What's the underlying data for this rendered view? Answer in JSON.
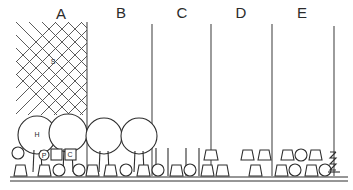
{
  "figure": {
    "type": "cross-section-profile-diagram",
    "style": "hand-drawn line drawing, black ink on white"
  },
  "canvas": {
    "width": 353,
    "height": 190,
    "background": "#ffffff",
    "ink": "#2e2e2e"
  },
  "section_labels": [
    {
      "id": "A",
      "label": "A",
      "x": 61,
      "y": 18
    },
    {
      "id": "B",
      "label": "B",
      "x": 121,
      "y": 17
    },
    {
      "id": "C",
      "label": "C",
      "x": 182,
      "y": 17
    },
    {
      "id": "D",
      "label": "D",
      "x": 241,
      "y": 17
    },
    {
      "id": "E",
      "label": "E",
      "x": 302,
      "y": 17
    }
  ],
  "dividers": [
    {
      "name": "divider-a-b",
      "x": 87,
      "y_top": 22,
      "y_bottom": 176
    },
    {
      "name": "divider-b-c",
      "x": 152,
      "y_top": 24,
      "y_bottom": 176
    },
    {
      "name": "divider-c-d",
      "x": 211,
      "y_top": 24,
      "y_bottom": 176
    },
    {
      "name": "divider-d-e",
      "x": 272,
      "y_top": 24,
      "y_bottom": 176
    },
    {
      "name": "divider-e-end",
      "x": 334,
      "y_top": 26,
      "y_bottom": 176
    }
  ],
  "hatch_zone": {
    "name": "hatched-area-a",
    "label": "S",
    "label_x": 53,
    "label_y": 62,
    "x": 16,
    "y": 22,
    "width": 71,
    "height": 93,
    "pattern": "diagonal cross-hatch diamond lattice",
    "spacing": 13
  },
  "canopy_trees": [
    {
      "name": "canopy-tree-1",
      "label": "H",
      "cx": 37,
      "cy": 135,
      "r": 19,
      "trunk_bottom": 172
    },
    {
      "name": "canopy-tree-2",
      "label": "",
      "cx": 68,
      "cy": 133,
      "r": 19,
      "trunk_bottom": 172
    },
    {
      "name": "canopy-tree-3",
      "label": "",
      "cx": 104,
      "cy": 136,
      "r": 18,
      "trunk_bottom": 172
    },
    {
      "name": "canopy-tree-4",
      "label": "",
      "cx": 139,
      "cy": 136,
      "r": 18,
      "trunk_bottom": 172
    }
  ],
  "marked_shapes": [
    {
      "name": "marked-circle-p",
      "label": "P",
      "type": "circle",
      "cx": 44,
      "cy": 155,
      "r": 5
    },
    {
      "name": "marked-square-c",
      "label": "C",
      "type": "square",
      "x": 65,
      "y": 149,
      "w": 11,
      "h": 11
    }
  ],
  "ground": {
    "name": "ground-line",
    "y": 177,
    "y2": 181,
    "x_start": 10,
    "x_end": 348
  },
  "shapes": [
    {
      "name": "shrub-circle",
      "type": "circle",
      "cx": 18,
      "cy": 153,
      "r": 6
    },
    {
      "name": "shrub-trapezoid",
      "type": "trapezoid",
      "cx": 20,
      "cy": 170,
      "w": 13,
      "h": 11
    },
    {
      "name": "shrub-trapezoid",
      "type": "trapezoid",
      "cx": 44,
      "cy": 170,
      "w": 13,
      "h": 11
    },
    {
      "name": "shrub-circle",
      "type": "circle",
      "cx": 59,
      "cy": 170,
      "r": 6
    },
    {
      "name": "shrub-circle",
      "type": "circle",
      "cx": 79,
      "cy": 170,
      "r": 6
    },
    {
      "name": "shrub-trapezoid",
      "type": "trapezoid",
      "cx": 92,
      "cy": 170,
      "w": 13,
      "h": 11
    },
    {
      "name": "shrub-trapezoid",
      "type": "trapezoid",
      "cx": 110,
      "cy": 170,
      "w": 13,
      "h": 11
    },
    {
      "name": "shrub-circle",
      "type": "circle",
      "cx": 126,
      "cy": 170,
      "r": 6
    },
    {
      "name": "shrub-trapezoid",
      "type": "trapezoid",
      "cx": 143,
      "cy": 170,
      "w": 13,
      "h": 11
    },
    {
      "name": "shrub-circle",
      "type": "circle",
      "cx": 158,
      "cy": 170,
      "r": 6
    },
    {
      "name": "shrub-trapezoid",
      "type": "trapezoid",
      "cx": 176,
      "cy": 170,
      "w": 13,
      "h": 11
    },
    {
      "name": "shrub-circle",
      "type": "circle",
      "cx": 190,
      "cy": 170,
      "r": 6
    },
    {
      "name": "shrub-trapezoid",
      "type": "trapezoid",
      "cx": 207,
      "cy": 170,
      "w": 13,
      "h": 11
    },
    {
      "name": "shrub-trapezoid",
      "type": "trapezoid",
      "cx": 207,
      "cy": 155,
      "w": 13,
      "h": 11
    },
    {
      "name": "shrub-trapezoid",
      "type": "trapezoid",
      "cx": 222,
      "cy": 170,
      "w": 13,
      "h": 11
    },
    {
      "name": "shrub-trapezoid",
      "type": "trapezoid",
      "cx": 247,
      "cy": 155,
      "w": 13,
      "h": 11
    },
    {
      "name": "shrub-trapezoid",
      "type": "trapezoid",
      "cx": 264,
      "cy": 155,
      "w": 13,
      "h": 11
    },
    {
      "name": "shrub-trapezoid",
      "type": "trapezoid",
      "cx": 255,
      "cy": 170,
      "w": 13,
      "h": 11
    },
    {
      "name": "shrub-trapezoid",
      "type": "trapezoid",
      "cx": 287,
      "cy": 155,
      "w": 13,
      "h": 11
    },
    {
      "name": "shrub-circle",
      "type": "circle",
      "cx": 301,
      "cy": 155,
      "r": 6
    },
    {
      "name": "shrub-trapezoid",
      "type": "trapezoid",
      "cx": 315,
      "cy": 155,
      "w": 13,
      "h": 11
    },
    {
      "name": "shrub-trapezoid",
      "type": "trapezoid",
      "cx": 281,
      "cy": 170,
      "w": 13,
      "h": 11
    },
    {
      "name": "shrub-circle",
      "type": "circle",
      "cx": 295,
      "cy": 170,
      "r": 6
    },
    {
      "name": "shrub-trapezoid",
      "type": "trapezoid",
      "cx": 311,
      "cy": 170,
      "w": 13,
      "h": 11
    },
    {
      "name": "shrub-circle",
      "type": "circle",
      "cx": 325,
      "cy": 170,
      "r": 6
    }
  ],
  "poles": [
    {
      "name": "pole-short",
      "x": 30,
      "y_top": 140,
      "y_bottom": 176
    },
    {
      "name": "pole-short",
      "x": 57,
      "y_top": 140,
      "y_bottom": 176
    },
    {
      "name": "pole-short",
      "x": 155,
      "y_top": 148,
      "y_bottom": 176
    },
    {
      "name": "pole-short",
      "x": 168,
      "y_top": 148,
      "y_bottom": 176
    },
    {
      "name": "pole-short",
      "x": 186,
      "y_top": 148,
      "y_bottom": 176
    },
    {
      "name": "pole-short",
      "x": 198,
      "y_top": 148,
      "y_bottom": 176
    }
  ],
  "antenna_mast": {
    "name": "antenna-mast-d",
    "x": 211,
    "y_top": 24,
    "y_bottom": 176
  },
  "zigzag_mast": {
    "name": "zigzag-mast-e",
    "x": 334,
    "y_top": 26,
    "y_bottom": 176,
    "note": "bracket / zigzag insulator detail near base"
  }
}
